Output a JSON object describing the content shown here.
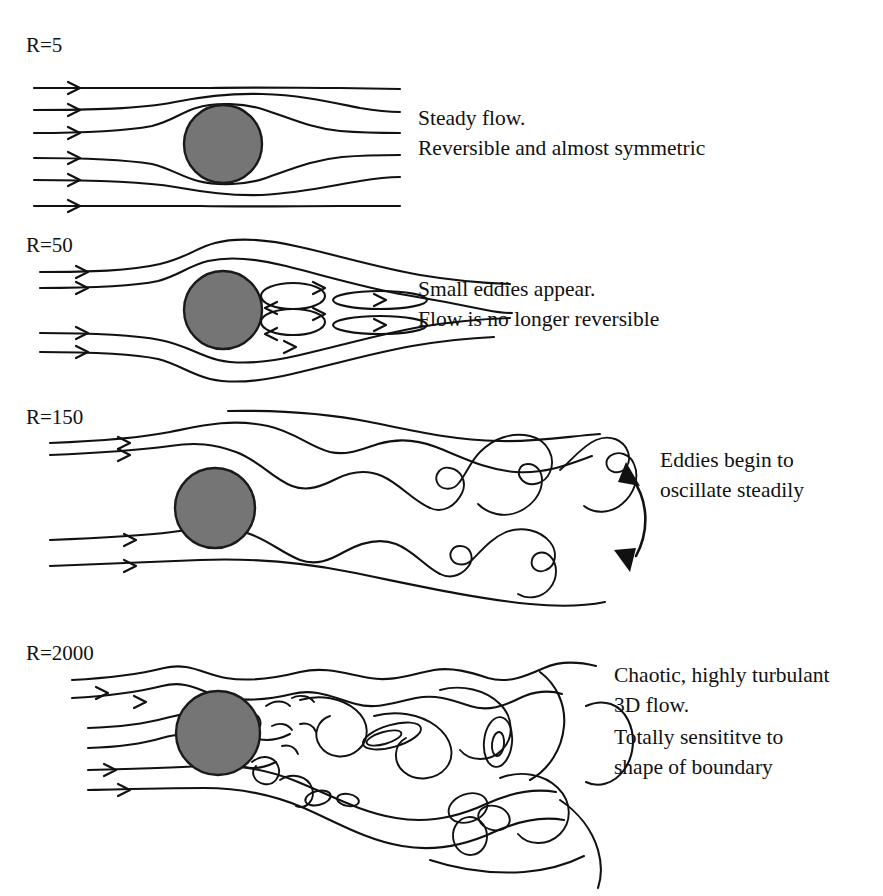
{
  "figure": {
    "background_color": "#ffffff",
    "ink_color": "#111111",
    "cylinder_fill_color": "#757575",
    "cylinder_stroke_color": "#1a1a1a"
  },
  "panels": [
    {
      "id": "panel-r5",
      "label": "R=5",
      "reynolds_number": 5,
      "caption_lines": [
        "Steady flow.",
        "Reversible and almost symmetric"
      ],
      "inlet_streamline_count": 6,
      "eddy_count": 0,
      "regime": "steady laminar"
    },
    {
      "id": "panel-r50",
      "label": "R=50",
      "reynolds_number": 50,
      "caption_lines": [
        "Small eddies appear.",
        "Flow is no longer reversible"
      ],
      "inlet_streamline_count": 4,
      "eddy_count": 4,
      "regime": "steady separated wake"
    },
    {
      "id": "panel-r150",
      "label": "R=150",
      "reynolds_number": 150,
      "caption_lines": [
        "Eddies begin to",
        "oscillate steadily"
      ],
      "inlet_streamline_count": 4,
      "eddy_count": 5,
      "regime": "von Karman vortex street",
      "annotation_icon": "double-headed-oscillation-arrow"
    },
    {
      "id": "panel-r2000",
      "label": "R=2000",
      "reynolds_number": 2000,
      "caption_lines": [
        "Chaotic, highly turbulant",
        "3D flow.",
        "Totally sensititve to",
        "shape of boundary"
      ],
      "inlet_streamline_count": 4,
      "regime": "fully turbulent"
    }
  ]
}
